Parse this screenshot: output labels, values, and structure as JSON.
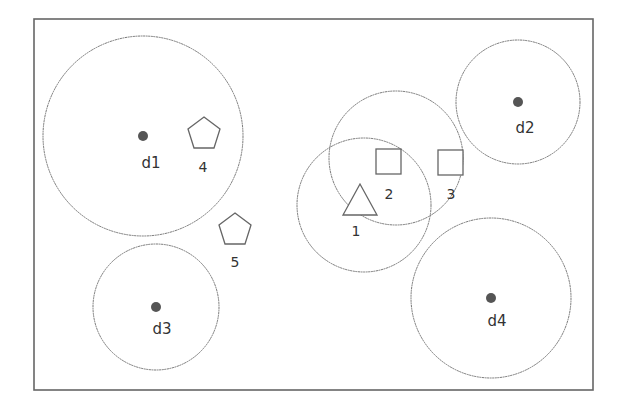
{
  "diagram": {
    "frame": {
      "x": 34,
      "y": 19,
      "width": 559,
      "height": 371
    },
    "depots": [
      {
        "id": "d1",
        "label": "d1",
        "cx": 143,
        "cy": 136,
        "r": 100,
        "label_x": 151,
        "label_y": 168
      },
      {
        "id": "d2",
        "label": "d2",
        "cx": 518,
        "cy": 102,
        "r": 62,
        "label_x": 525,
        "label_y": 133
      },
      {
        "id": "d3",
        "label": "d3",
        "cx": 156,
        "cy": 307,
        "r": 63,
        "label_x": 162,
        "label_y": 334
      },
      {
        "id": "d4",
        "label": "d4",
        "cx": 491,
        "cy": 298,
        "r": 80,
        "label_x": 497,
        "label_y": 326
      }
    ],
    "nodes": [
      {
        "id": "1",
        "label": "1",
        "shape": "triangle",
        "x": 360,
        "y": 200,
        "label_x": 356,
        "label_y": 236,
        "range_r": 67,
        "range_cx": 364,
        "range_cy": 205
      },
      {
        "id": "2",
        "label": "2",
        "shape": "square",
        "x": 388,
        "y": 161,
        "label_x": 389,
        "label_y": 199,
        "range_r": 67,
        "range_cx": 396,
        "range_cy": 158
      },
      {
        "id": "3",
        "label": "3",
        "shape": "square",
        "x": 450,
        "y": 162,
        "label_x": 451,
        "label_y": 199
      },
      {
        "id": "4",
        "label": "4",
        "shape": "pentagon",
        "x": 204,
        "y": 134,
        "label_x": 203,
        "label_y": 172
      },
      {
        "id": "5",
        "label": "5",
        "shape": "pentagon",
        "x": 235,
        "y": 230,
        "label_x": 235,
        "label_y": 267
      }
    ],
    "colors": {
      "stroke": "#777777",
      "depot_fill": "#555555",
      "label": "#333333"
    }
  }
}
